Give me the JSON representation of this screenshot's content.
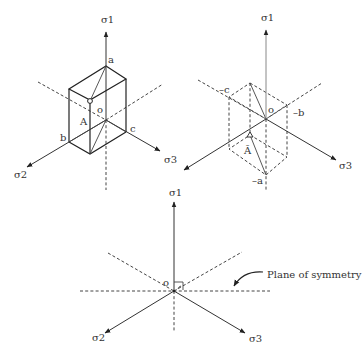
{
  "figure": {
    "panels": [
      {
        "id": "cube-principal-stress",
        "axes": {
          "vertical": "σ1",
          "left": "σ2",
          "right": "σ3"
        },
        "origin_label": "o",
        "vertex_labels": {
          "a": "a",
          "b": "b",
          "c": "c"
        },
        "point_label": "A"
      },
      {
        "id": "cube-negative",
        "axes": {
          "vertical": "σ1",
          "left": "σ2",
          "right": "σ3"
        },
        "origin_label": "o",
        "vertex_labels": {
          "a": "–a",
          "b": "–b",
          "c": "–c"
        },
        "point_label": "Ā"
      },
      {
        "id": "symmetry-plane",
        "axes": {
          "vertical": "σ1",
          "left": "σ2",
          "right": "σ3"
        },
        "origin_label": "o",
        "annotation": "Plane of symmetry"
      }
    ],
    "colors": {
      "line": "#222222",
      "axis_gray": "#888888",
      "text": "#333333",
      "background": "#ffffff"
    }
  }
}
